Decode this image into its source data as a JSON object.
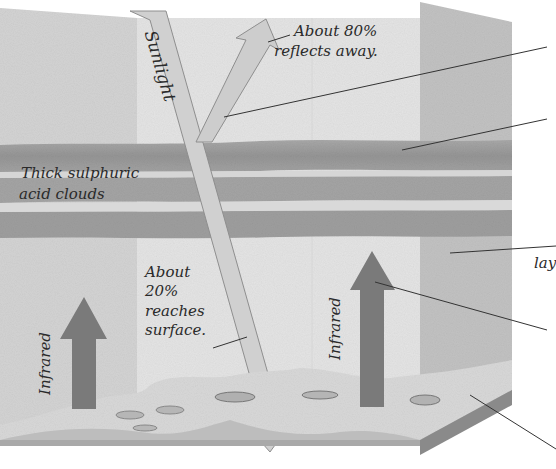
{
  "diagram": {
    "labels": {
      "sunlight": "Sunlight",
      "reflect_line1": "About 80%",
      "reflect_line2": "reflects away.",
      "clouds_line1": "Thick sulphuric",
      "clouds_line2": "acid clouds",
      "surface_line1": "About",
      "surface_line2": "20%",
      "surface_line3": "reaches",
      "surface_line4": "surface.",
      "infrared_left": "Infrared",
      "infrared_right": "Infrared",
      "cut_off_right": "lay"
    },
    "colors": {
      "background": "#ffffff",
      "left_panel": "#d4d4d4",
      "center_panel": "#e6e6e6",
      "right_panel": "#c4c4c4",
      "cloud_dark": "#9c9c9c",
      "cloud_light": "#cfcfcf",
      "sunlight_arrow": "#d2d2d2",
      "infrared_arrow": "#7a7a7a",
      "ground": "#a8a8a8",
      "ground_side": "#8a8a8a",
      "leader_line": "#333333"
    }
  }
}
